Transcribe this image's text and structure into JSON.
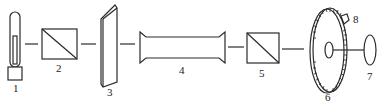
{
  "diagram": {
    "type": "optical-setup",
    "components": [
      {
        "id": "1",
        "label": "1",
        "icon": "lamp-icon"
      },
      {
        "id": "2",
        "label": "2",
        "icon": "polarizer-prism-icon"
      },
      {
        "id": "3",
        "label": "3",
        "icon": "plate-icon"
      },
      {
        "id": "4",
        "label": "4",
        "icon": "sample-tube-icon"
      },
      {
        "id": "5",
        "label": "5",
        "icon": "analyzer-prism-icon"
      },
      {
        "id": "6",
        "label": "6",
        "icon": "graduated-dial-icon"
      },
      {
        "id": "7",
        "label": "7",
        "icon": "eyepiece-icon"
      },
      {
        "id": "8",
        "label": "8",
        "icon": "pointer-icon"
      }
    ],
    "colors": {
      "stroke": "#2a2a2a",
      "background": "#ffffff"
    }
  }
}
